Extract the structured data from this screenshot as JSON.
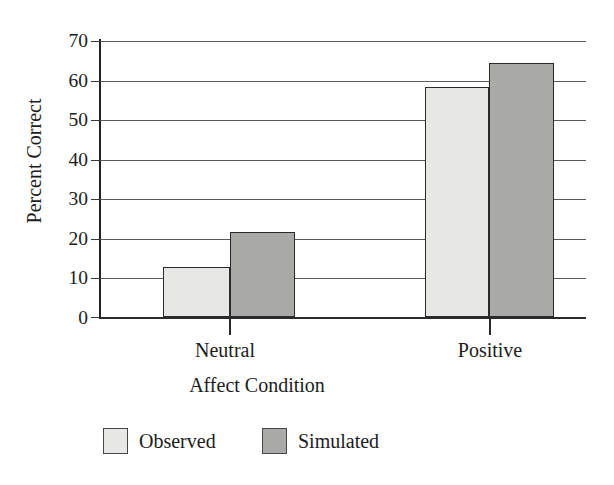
{
  "chart_data": {
    "type": "bar",
    "title": "",
    "subtitle": "",
    "xlabel": "Affect Condition",
    "ylabel": "Percent Correct",
    "categories": [
      "Neutral",
      "Positive"
    ],
    "series": [
      {
        "name": "Observed",
        "color": "#e7e7e5",
        "values": [
          12.7,
          58.3
        ]
      },
      {
        "name": "Simulated",
        "color": "#a9a9a7",
        "values": [
          21.5,
          64.4
        ]
      }
    ],
    "ylim": [
      0,
      70
    ],
    "ytick_values": [
      0,
      10,
      20,
      30,
      40,
      50,
      60,
      70
    ],
    "ytick_labels": [
      "0",
      "10",
      "20",
      "30",
      "40",
      "50",
      "60",
      "70"
    ],
    "ytick_interval": 10,
    "grid": "horizontal",
    "legend_position": "bottom",
    "bar_edge_color": "#2a2a2a",
    "axis_color": "#222222",
    "background": "#ffffff"
  },
  "axes": {
    "y_title": "Percent Correct",
    "x_title": "Affect Condition",
    "y_ticks": [
      {
        "label": "70"
      },
      {
        "label": "60"
      },
      {
        "label": "50"
      },
      {
        "label": "40"
      },
      {
        "label": "30"
      },
      {
        "label": "20"
      },
      {
        "label": "10"
      },
      {
        "label": "0"
      }
    ],
    "x_categories": [
      {
        "label": "Neutral"
      },
      {
        "label": "Positive"
      }
    ]
  },
  "legend": {
    "items": [
      {
        "label": "Observed",
        "swatch": "light-gray-swatch"
      },
      {
        "label": "Simulated",
        "swatch": "dark-gray-swatch"
      }
    ]
  }
}
